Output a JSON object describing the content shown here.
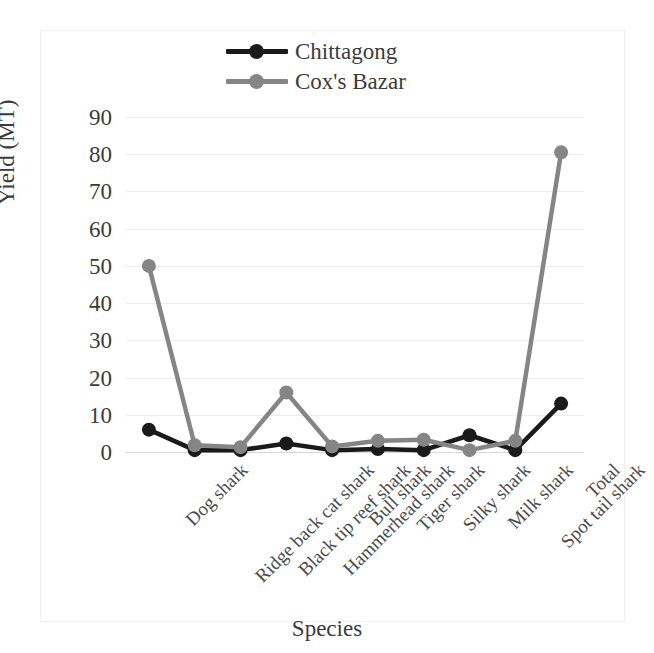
{
  "chart_data": {
    "type": "line",
    "title": "",
    "xlabel": "Species",
    "ylabel": "Yield (MT)",
    "ylim": [
      0,
      90
    ],
    "ytick_step": 10,
    "yticks": [
      90,
      80,
      70,
      60,
      50,
      40,
      30,
      20,
      10,
      0
    ],
    "grid": true,
    "legend_position": "top-center",
    "categories": [
      "Dog shark",
      "Ridge back cat shark",
      "Black tip reef shark",
      "Hammerhead shark",
      "Bull shark",
      "Tiger shark",
      "Silky shark",
      "Milk shark",
      "Spot tail shark",
      "Total"
    ],
    "series": [
      {
        "name": "Chittagong",
        "color": "#1a1a1a",
        "marker": "circle",
        "values": [
          6,
          0.5,
          0.5,
          2.3,
          0.5,
          0.8,
          0.5,
          4.5,
          0.5,
          13
        ]
      },
      {
        "name": "Cox's Bazar",
        "color": "#858585",
        "marker": "circle",
        "values": [
          50,
          1.8,
          1.3,
          16,
          1.5,
          3,
          3.3,
          0.5,
          3,
          80.5
        ]
      }
    ]
  },
  "legend": {
    "items": [
      {
        "label": "Chittagong",
        "color": "#1a1a1a"
      },
      {
        "label": "Cox's Bazar",
        "color": "#858585"
      }
    ]
  },
  "axes": {
    "y_title": "Yield (MT)",
    "x_title": "Species",
    "y_tick_labels": [
      "90",
      "80",
      "70",
      "60",
      "50",
      "40",
      "30",
      "20",
      "10",
      "0"
    ]
  }
}
